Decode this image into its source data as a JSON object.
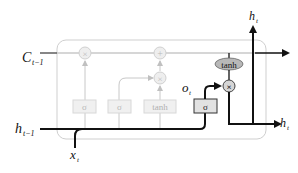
{
  "diagram": {
    "colors": {
      "active": "#111111",
      "faded": "#c8c8c8",
      "faded_text": "#b0b0b0",
      "box_border": "#c8c8c8",
      "gate_fill": "#e6e6e6",
      "tanh_fill": "#b4b4b4",
      "op_fill": "#d0d0d0"
    },
    "labels": {
      "c_prev": {
        "main": "C",
        "sub": "t−1"
      },
      "h_prev": {
        "main": "h",
        "sub": "t−1"
      },
      "x_t": {
        "main": "x",
        "sub": "t"
      },
      "o_t": {
        "main": "o",
        "sub": "t"
      },
      "h_t_top": {
        "main": "h",
        "sub": "t"
      },
      "h_t_right": {
        "main": "h",
        "sub": "t"
      }
    },
    "gates": [
      {
        "id": "forget",
        "label": "σ",
        "active": false
      },
      {
        "id": "input",
        "label": "σ",
        "active": false
      },
      {
        "id": "candidate",
        "label": "tanh",
        "active": false
      },
      {
        "id": "output",
        "label": "σ",
        "active": true
      }
    ],
    "ops": {
      "forget_mul": "×",
      "cell_add": "+",
      "input_mul": "×",
      "output_mul": "×",
      "cell_tanh": "tanh"
    }
  }
}
